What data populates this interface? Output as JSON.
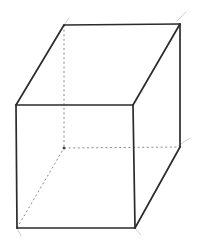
{
  "figure": {
    "name": "cube-wireframe",
    "background_color": "#ffffff",
    "canvas": {
      "width": 199,
      "height": 240
    },
    "stroke_colors": {
      "visible_edge": "#2b2b2b",
      "hidden_edge": "#8a8a8a",
      "overshoot_artifact": "#c9c9c9"
    },
    "stroke_widths": {
      "visible_edge": 1.7,
      "hidden_edge": 1.0,
      "overshoot_artifact": 0.9
    },
    "hidden_edge_dash": "2,2.6",
    "vertices": {
      "front_top_left": {
        "x": 16,
        "y": 105
      },
      "front_top_right": {
        "x": 133,
        "y": 105
      },
      "front_bottom_right": {
        "x": 135,
        "y": 228
      },
      "front_bottom_left": {
        "x": 17,
        "y": 228
      },
      "back_top_left": {
        "x": 64,
        "y": 25
      },
      "back_top_right": {
        "x": 180,
        "y": 24
      },
      "back_bottom_right": {
        "x": 180,
        "y": 147
      },
      "back_bottom_left": {
        "x": 64,
        "y": 148
      }
    },
    "visible_edges": [
      {
        "name": "front-face-top",
        "from": "front_top_left",
        "to": "front_top_right"
      },
      {
        "name": "front-face-right",
        "from": "front_top_right",
        "to": "front_bottom_right"
      },
      {
        "name": "front-face-bottom",
        "from": "front_bottom_right",
        "to": "front_bottom_left"
      },
      {
        "name": "front-face-left",
        "from": "front_bottom_left",
        "to": "front_top_left"
      },
      {
        "name": "top-face-back",
        "from": "back_top_left",
        "to": "back_top_right"
      },
      {
        "name": "top-face-left-receding",
        "from": "front_top_left",
        "to": "back_top_left"
      },
      {
        "name": "top-face-right-receding",
        "from": "front_top_right",
        "to": "back_top_right"
      },
      {
        "name": "right-face-back-vertical",
        "from": "back_top_right",
        "to": "back_bottom_right"
      },
      {
        "name": "right-face-bottom-receding",
        "from": "front_bottom_right",
        "to": "back_bottom_right"
      }
    ],
    "hidden_edges": [
      {
        "name": "back-face-left-vertical",
        "from": "back_top_left",
        "to": "back_bottom_left"
      },
      {
        "name": "bottom-face-back",
        "from": "back_bottom_left",
        "to": "back_bottom_right"
      },
      {
        "name": "bottom-face-left-receding",
        "from": "front_bottom_left",
        "to": "back_bottom_left"
      }
    ],
    "overshoot_artifacts": [
      {
        "name": "top-right-overshoot",
        "x1": 177,
        "y1": 21,
        "x2": 186,
        "y2": 12
      },
      {
        "name": "top-left-overshoot",
        "x1": 64,
        "y1": 25,
        "x2": 69,
        "y2": 18
      },
      {
        "name": "mid-right-overshoot",
        "x1": 178,
        "y1": 146,
        "x2": 190,
        "y2": 138
      },
      {
        "name": "bottom-left-overshoot",
        "x1": 17,
        "y1": 228,
        "x2": 21,
        "y2": 236
      },
      {
        "name": "bottom-right-overshoot",
        "x1": 135,
        "y1": 228,
        "x2": 141,
        "y2": 235
      }
    ],
    "vertex_dots": [
      {
        "name": "hidden-corner-dot",
        "x": 64,
        "y": 148,
        "r": 1.5
      }
    ]
  }
}
